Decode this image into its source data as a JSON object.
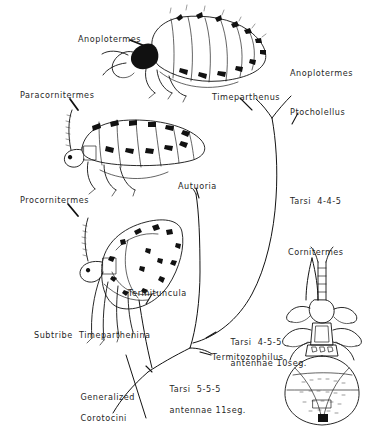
{
  "figure": {
    "domain": "scientific-illustration",
    "background_color": "#ffffff",
    "ink_color": "#111111"
  },
  "host_labels": [
    {
      "id": "anoplotermes-left",
      "text": "Anoplotermes",
      "x": 78,
      "y": 34,
      "leader": true
    },
    {
      "id": "paracornitermes",
      "text": "Paracornitermes",
      "x": 20,
      "y": 90,
      "leader": true
    },
    {
      "id": "procornitermes",
      "text": "Procornitermes",
      "x": 20,
      "y": 195,
      "leader": true
    },
    {
      "id": "anoplotermes-right",
      "text": "Anoplotermes",
      "x": 290,
      "y": 68,
      "leader": false
    },
    {
      "id": "timeparthenus",
      "text": "Timeparthenus",
      "x": 212,
      "y": 92,
      "leader": true
    },
    {
      "id": "ptocholellus",
      "text": "Ptocholellus",
      "x": 290,
      "y": 107,
      "leader": true
    },
    {
      "id": "autuoria",
      "text": "Autuoria",
      "x": 178,
      "y": 181,
      "leader": true
    },
    {
      "id": "cornitermes",
      "text": "Cornitermes",
      "x": 288,
      "y": 247,
      "leader": true
    },
    {
      "id": "termituncula",
      "text": "Termituncula",
      "x": 128,
      "y": 288,
      "leader": true
    },
    {
      "id": "termitozophilus",
      "text": "Termitozophilus",
      "x": 212,
      "y": 352,
      "leader": true
    }
  ],
  "character_labels": [
    {
      "id": "tarsi-445",
      "text": "Tarsi  4-4-5",
      "x": 290,
      "y": 196
    },
    {
      "id": "tarsi-455",
      "line1": "Tarsi  4-5-5",
      "line2": "antennae 10seg.",
      "x": 218,
      "y": 327
    },
    {
      "id": "tarsi-555",
      "line1": "Tarsi  5-5-5",
      "line2": "antennae 11seg.",
      "x": 157,
      "y": 374
    }
  ],
  "taxon_labels": [
    {
      "id": "subtribe",
      "text": "Subtribe  Timeparthenina",
      "x": 34,
      "y": 330
    },
    {
      "id": "generalized-corotocini",
      "line1": "Generalized",
      "line2": "Corotocini",
      "x": 68,
      "y": 382
    }
  ],
  "specimens": [
    {
      "id": "specimen-top",
      "name": "physogastric-beetle-lateral-anoplotermes-guest",
      "caption_ref": "anoplotermes-left"
    },
    {
      "id": "specimen-middle",
      "name": "physogastric-beetle-lateral-paracornitermes-guest",
      "caption_ref": "paracornitermes"
    },
    {
      "id": "specimen-lower",
      "name": "physogastric-beetle-lateral-procornitermes-guest",
      "caption_ref": "procornitermes"
    },
    {
      "id": "specimen-right",
      "name": "physogastric-beetle-dorsal-cornitermes-guest",
      "caption_ref": "cornitermes"
    }
  ],
  "tree": {
    "description": "Branching cladogram rising from Generalized Corotocini at lower left toward host-associated genera at upper right",
    "root_label": "generalized-corotocini",
    "nodes": [
      "Generalized Corotocini",
      "Tarsi 5-5-5 antennae 11seg.",
      "Tarsi 4-5-5 antennae 10seg.",
      "Tarsi 4-4-5"
    ],
    "tips": [
      "Termituncula",
      "Autuoria",
      "Timeparthenus",
      "Ptocholellus",
      "Anoplotermes",
      "Cornitermes",
      "Termitozophilus"
    ]
  }
}
